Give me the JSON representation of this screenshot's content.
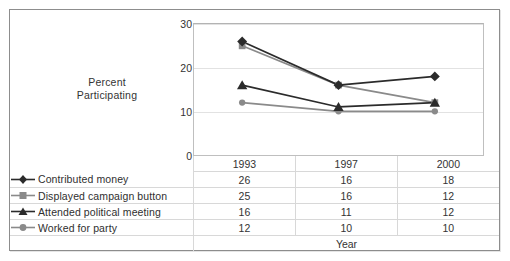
{
  "chart_data": {
    "type": "line",
    "title": "",
    "xlabel": "Year",
    "ylabel": "Percent Participating",
    "categories": [
      "1993",
      "1997",
      "2000"
    ],
    "ylim": [
      0,
      30
    ],
    "yticks": [
      0,
      10,
      20,
      30
    ],
    "grid": true,
    "legend_position": "bottom-table",
    "series": [
      {
        "name": "Contributed money",
        "values": [
          26,
          16,
          18
        ],
        "marker": "diamond",
        "color": "#2b2b2b"
      },
      {
        "name": "Displayed campaign button",
        "values": [
          25,
          16,
          12
        ],
        "marker": "square",
        "color": "#8a8a8a"
      },
      {
        "name": "Attended political meeting",
        "values": [
          16,
          11,
          12
        ],
        "marker": "triangle",
        "color": "#2b2b2b"
      },
      {
        "name": "Worked for party",
        "values": [
          12,
          10,
          10
        ],
        "marker": "circle",
        "color": "#8a8a8a"
      }
    ]
  },
  "axis": {
    "y_label_line1": "Percent",
    "y_label_line2": "Participating",
    "y_ticks": [
      "30",
      "20",
      "10",
      "0"
    ],
    "x_title": "Year"
  },
  "table": {
    "year_headers": [
      "1993",
      "1997",
      "2000"
    ],
    "rows": [
      {
        "label": "Contributed money",
        "values": [
          "26",
          "16",
          "18"
        ]
      },
      {
        "label": "Displayed campaign button",
        "values": [
          "25",
          "16",
          "12"
        ]
      },
      {
        "label": "Attended political meeting",
        "values": [
          "16",
          "11",
          "12"
        ]
      },
      {
        "label": "Worked for party",
        "values": [
          "12",
          "10",
          "10"
        ]
      }
    ]
  },
  "colors": {
    "dark_series": "#2b2b2b",
    "gray_series": "#8a8a8a",
    "gridline": "#e2e2e2",
    "border": "#8d8d8d",
    "text": "#333333"
  }
}
